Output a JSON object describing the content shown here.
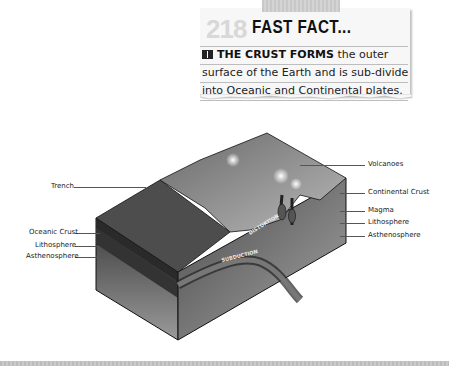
{
  "fact_card": {
    "number": "218",
    "title": "FAST FACT...",
    "icon": "book-icon",
    "lead": "THE CRUST FORMS",
    "line1_rest": " the outer",
    "line2": "surface of the Earth and is sub-divided",
    "line3": "into Oceanic and Continental plates."
  },
  "diagram": {
    "labels_left": [
      "Trench",
      "Oceanic Crust",
      "Lithosphere",
      "Asthenosphere"
    ],
    "labels_right": [
      "Volcanoes",
      "Continental Crust",
      "Magma",
      "Lithosphere",
      "Asthenosphere"
    ],
    "inline_labels": [
      "DISTORTION",
      "SUBDUCTION"
    ]
  }
}
